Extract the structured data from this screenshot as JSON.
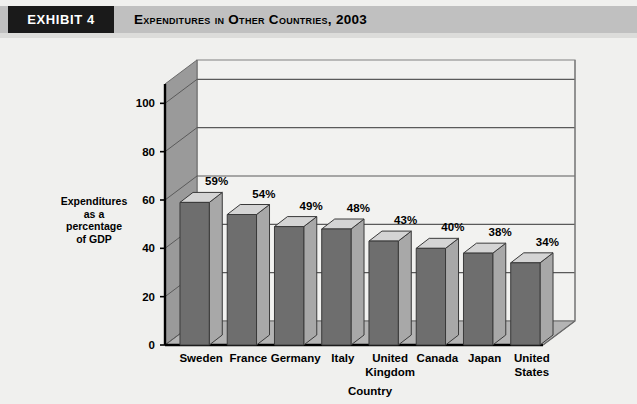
{
  "header": {
    "exhibit_tag": "EXHIBIT 4",
    "title": "Expenditures in Other Countries, 2003",
    "tag_bg": "#1a1a1a",
    "band_bg": "#c0c0c0"
  },
  "chart_data": {
    "type": "bar",
    "title": "Expenditures in Other Countries, 2003",
    "categories": [
      "Sweden",
      "France",
      "Germany",
      "Italy",
      "United Kingdom",
      "Canada",
      "Japan",
      "United States"
    ],
    "values": [
      59,
      54,
      49,
      48,
      43,
      40,
      38,
      34
    ],
    "data_labels": [
      "59%",
      "54%",
      "49%",
      "48%",
      "43%",
      "40%",
      "38%",
      "34%"
    ],
    "xlabel": "Country",
    "ylabel": "Expenditures as a percentage of GDP",
    "ylabel_lines": [
      "Expenditures",
      "as a",
      "percentage",
      "of GDP"
    ],
    "ytick_labels": [
      "0",
      "20",
      "40",
      "60",
      "80",
      "100"
    ],
    "ytick_values": [
      0,
      20,
      40,
      60,
      80,
      100
    ],
    "ylim": [
      0,
      108
    ],
    "grid": true,
    "legend": "none",
    "style": "3d-column",
    "colors": {
      "bar_front": "#6e6e6e",
      "bar_top": "#d4d4d4",
      "bar_side": "#a8a8a8",
      "wall_back": "#f2f2f0",
      "wall_left": "#9a9a9a",
      "floor": "#b4b4b4",
      "axis": "#000000",
      "gridline": "#5a5a5a"
    }
  }
}
